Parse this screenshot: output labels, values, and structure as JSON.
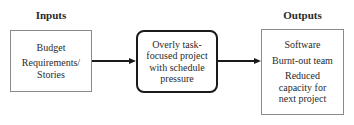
{
  "inputs": {
    "heading": "Inputs",
    "items": [
      "Budget",
      "Requirements/\nStories"
    ]
  },
  "process": {
    "label": "Overly task-\nfocused project\nwith schedule\npressure"
  },
  "outputs": {
    "heading": "Outputs",
    "items": [
      "Software",
      "Burnt-out team",
      "Reduced\ncapacity for\nnext project"
    ]
  },
  "colors": {
    "box_border": "#8a8a8a",
    "process_border": "#1a1a1a",
    "arrow": "#1a1a1a"
  }
}
